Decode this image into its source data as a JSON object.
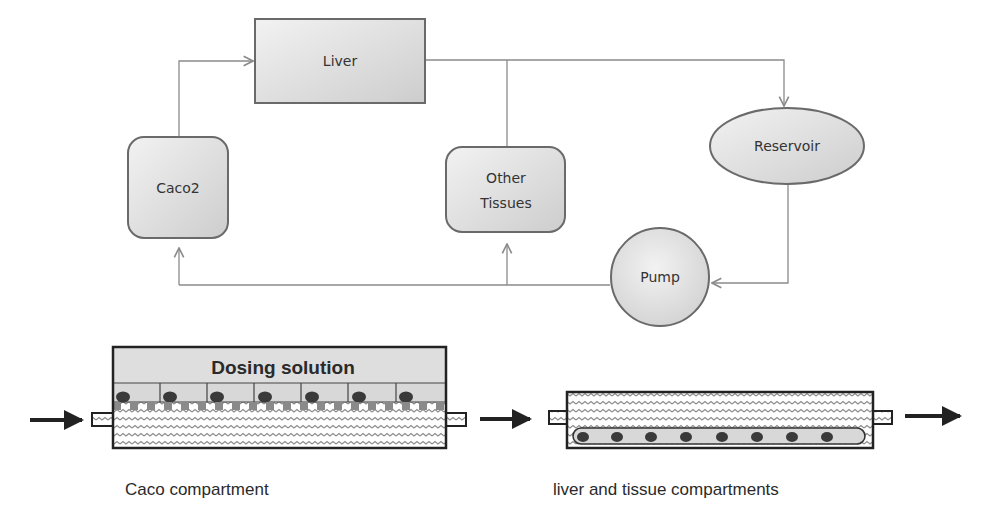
{
  "flowchart": {
    "nodes": {
      "liver": {
        "label": "Liver"
      },
      "caco2": {
        "label": "Caco2"
      },
      "other_tissues": {
        "label_line1": "Other",
        "label_line2": "Tissues"
      },
      "reservoir": {
        "label": "Reservoir"
      },
      "pump": {
        "label": "Pump"
      }
    },
    "edges": [
      {
        "from": "Caco2",
        "to": "Liver"
      },
      {
        "from": "Liver",
        "to": "Other Tissues"
      },
      {
        "from": "Liver",
        "to": "Reservoir"
      },
      {
        "from": "Reservoir",
        "to": "Pump"
      },
      {
        "from": "Pump",
        "to": "Other Tissues"
      },
      {
        "from": "Pump",
        "to": "Caco2"
      }
    ]
  },
  "compartments": {
    "caco": {
      "dosing_label": "Dosing solution",
      "caption": "Caco compartment",
      "cell_count": 7
    },
    "liver_tissue": {
      "caption": "liver and tissue compartments",
      "cell_count": 8
    }
  },
  "colors": {
    "node_fill_light": "#f0f0f0",
    "node_fill_dark": "#cfcfcf",
    "node_stroke": "#6a6a6a",
    "connector": "#8a8a8a",
    "compartment_stroke": "#222222",
    "dosing_fill": "#dedede",
    "cell_fill": "#d8d8d8",
    "nucleus_fill": "#3a3a3a"
  }
}
